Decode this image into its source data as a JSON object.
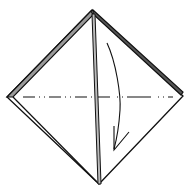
{
  "diagram": {
    "colors": {
      "background": "#ffffff",
      "line": "#111111",
      "layer_fill": "#9a9a9a"
    },
    "shape": {
      "type": "square-diamond",
      "top": [
        92,
        10
      ],
      "left": [
        7,
        97
      ],
      "right": [
        183,
        96
      ],
      "bottom": [
        99,
        184
      ]
    },
    "elements": [
      {
        "id": "paper-outline",
        "kind": "polygon",
        "label": "paper"
      },
      {
        "id": "center-crease",
        "kind": "double-line",
        "label": "center layered edge"
      },
      {
        "id": "left-layer-edge",
        "kind": "double-line",
        "label": "upper-left layered edge"
      },
      {
        "id": "right-layer-edge",
        "kind": "double-line",
        "label": "upper-right layered edge"
      },
      {
        "id": "valley-fold-line",
        "kind": "dash-dot",
        "label": "valley fold line"
      },
      {
        "id": "fold-arrow",
        "kind": "curved-arrow",
        "label": "fold down direction"
      }
    ]
  }
}
